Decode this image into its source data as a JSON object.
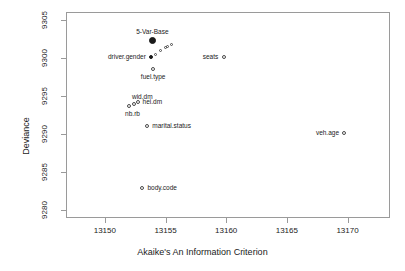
{
  "chart_data": {
    "type": "scatter",
    "title": "",
    "xlabel": "Akaike's An Information Criterion",
    "ylabel": "Deviance",
    "xlim": [
      13146.8,
      13173.5
    ],
    "ylim": [
      9279.0,
      9306.0
    ],
    "xticks": [
      13150,
      13155,
      13160,
      13165,
      13170
    ],
    "xticklabels": [
      "13150",
      "13155",
      "13160",
      "13165",
      "13170"
    ],
    "yticks": [
      9280,
      9285,
      9290,
      9295,
      9300,
      9305
    ],
    "yticklabels": [
      "9280",
      "9285",
      "9290",
      "9295",
      "9300",
      "9305"
    ],
    "grid": false,
    "legend": false,
    "points": [
      {
        "label": "5-Var-Base",
        "x": 13153.9,
        "y": 9302.3,
        "marker": "filled",
        "label_pos": "above"
      },
      {
        "label": "driver.gender",
        "x": 13153.8,
        "y": 9300.1,
        "marker": "filled-small",
        "label_pos": "left"
      },
      {
        "label": "",
        "x": 13154.2,
        "y": 9300.4,
        "marker": "small",
        "label_pos": "none"
      },
      {
        "label": "",
        "x": 13154.6,
        "y": 9301.0,
        "marker": "small",
        "label_pos": "none"
      },
      {
        "label": "",
        "x": 13155.0,
        "y": 9301.4,
        "marker": "small",
        "label_pos": "none"
      },
      {
        "label": "",
        "x": 13155.2,
        "y": 9301.5,
        "marker": "small",
        "label_pos": "none"
      },
      {
        "label": "",
        "x": 13155.5,
        "y": 9301.7,
        "marker": "small",
        "label_pos": "none"
      },
      {
        "label": "fuel.type",
        "x": 13154.0,
        "y": 9298.5,
        "marker": "open",
        "label_pos": "below"
      },
      {
        "label": "seats",
        "x": 13159.8,
        "y": 9300.1,
        "marker": "open",
        "label_pos": "left"
      },
      {
        "label": "wid.dm",
        "x": 13152.4,
        "y": 9294.0,
        "marker": "open",
        "label_pos": "above-right"
      },
      {
        "label": "hei.dm",
        "x": 13152.7,
        "y": 9294.2,
        "marker": "open",
        "label_pos": "right"
      },
      {
        "label": "nb.rb",
        "x": 13152.0,
        "y": 9293.7,
        "marker": "open",
        "label_pos": "below-right"
      },
      {
        "label": "marital.status",
        "x": 13153.5,
        "y": 9291.1,
        "marker": "open",
        "label_pos": "right"
      },
      {
        "label": "veh.age",
        "x": 13169.7,
        "y": 9290.1,
        "marker": "open",
        "label_pos": "left"
      },
      {
        "label": "body.code",
        "x": 13153.1,
        "y": 9282.9,
        "marker": "open",
        "label_pos": "right"
      }
    ]
  }
}
